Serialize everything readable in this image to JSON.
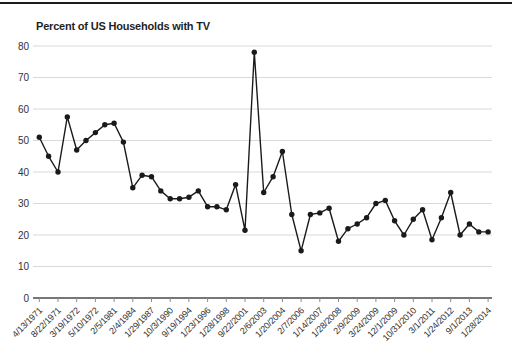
{
  "page": {
    "top_rule_color": "#1b1b1b"
  },
  "chart_data": {
    "type": "line",
    "title": "Percent of US Households with TV",
    "xlabel": "",
    "ylabel": "",
    "ylim": [
      0,
      80
    ],
    "yticks": [
      0,
      10,
      20,
      30,
      40,
      50,
      60,
      70,
      80
    ],
    "grid": "horizontal gridlines at each y tick",
    "legend_position": "none",
    "line_color": "#1a1a1a",
    "marker_style": "filled circle",
    "grid_color": "#d9d9d9",
    "baseline_color": "#4a4a4a",
    "tick_color": "#8a8a8a",
    "label_color": "#333333",
    "x_tick_label_rotation_deg": -45,
    "x_label_every_n_points": 2,
    "tick_labels": [
      "4/13/1971",
      "8/22/1971",
      "3/19/1972",
      "5/10/1972",
      "2/5/1981",
      "2/4/1984",
      "1/29/1987",
      "10/3/1990",
      "9/19/1994",
      "1/23/1996",
      "1/28/1998",
      "9/22/2001",
      "2/6/2003",
      "1/20/2004",
      "2/7/2006",
      "1/14/2007",
      "1/28/2008",
      "2/9/2009",
      "3/24/2009",
      "12/1/2009",
      "10/31/2010",
      "3/1/2011",
      "1/24/2012",
      "9/1/2013",
      "1/28/2014"
    ],
    "values": [
      51,
      45,
      40,
      57.5,
      47,
      50,
      52.5,
      55,
      55.5,
      49.5,
      35,
      39,
      38.5,
      34,
      31.5,
      31.5,
      32,
      34,
      29,
      29,
      28,
      36,
      21.5,
      78,
      33.5,
      38.5,
      46.5,
      26.5,
      15,
      26.5,
      27,
      28.5,
      18,
      22,
      23.5,
      25.5,
      30,
      31,
      24.5,
      20,
      25,
      28,
      18.5,
      25.5,
      33.5,
      20,
      23.5,
      21,
      21
    ]
  }
}
